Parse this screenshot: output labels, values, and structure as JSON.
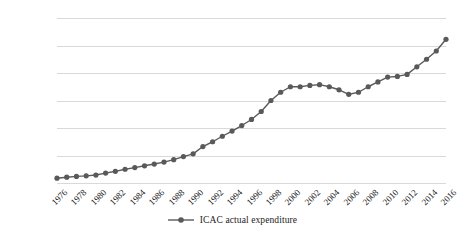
{
  "chart_data": {
    "type": "line",
    "title": "",
    "subtitle": "",
    "xlabel": "",
    "ylabel": "",
    "ylim": [
      0,
      1200
    ],
    "ytick_labels": [
      "0",
      "200",
      "400",
      "600",
      "800",
      "1,000",
      "1,200"
    ],
    "ytick_values": [
      0,
      200,
      400,
      600,
      800,
      1000,
      1200
    ],
    "grid": true,
    "legend_position": "bottom",
    "xtick_labels": [
      "1976",
      "1978",
      "1980",
      "1982",
      "1984",
      "1986",
      "1988",
      "1990",
      "1992",
      "1994",
      "1996",
      "1998",
      "2000",
      "2002",
      "2004",
      "2006",
      "2008",
      "2010",
      "2012",
      "2014",
      "2016"
    ],
    "series": [
      {
        "name": "ICAC actual expenditure",
        "color": "#595959",
        "marker": "circle",
        "x": [
          1976,
          1977,
          1978,
          1979,
          1980,
          1981,
          1982,
          1983,
          1984,
          1985,
          1986,
          1987,
          1988,
          1989,
          1990,
          1991,
          1992,
          1993,
          1994,
          1995,
          1996,
          1997,
          1998,
          1999,
          2000,
          2001,
          2002,
          2003,
          2004,
          2005,
          2006,
          2007,
          2008,
          2009,
          2010,
          2011,
          2012,
          2013,
          2014,
          2015,
          2016
        ],
        "values": [
          35,
          42,
          48,
          52,
          58,
          72,
          85,
          100,
          112,
          125,
          138,
          152,
          170,
          192,
          212,
          265,
          300,
          340,
          378,
          418,
          462,
          520,
          600,
          660,
          700,
          700,
          710,
          715,
          700,
          678,
          645,
          660,
          700,
          735,
          770,
          775,
          790,
          845,
          900,
          960,
          1045
        ]
      }
    ]
  },
  "legend": {
    "entries": [
      {
        "label": "ICAC actual expenditure",
        "color": "#595959"
      }
    ]
  }
}
